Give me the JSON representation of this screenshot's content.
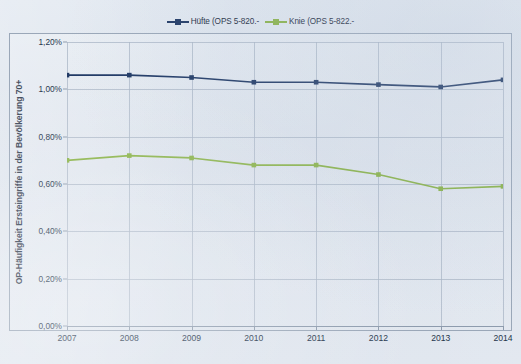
{
  "legend": {
    "position": "top-center",
    "entries": [
      {
        "label": "Hüfte (OPS 5-820.-",
        "color": "#1f3864",
        "marker": "square-marker"
      },
      {
        "label": "Knie (OPS 5-822.-",
        "color": "#8ab348",
        "marker": "square-marker"
      }
    ]
  },
  "axes": {
    "ylabel": "OP-Häufigkeit Ersteingriffe in der Bevölkerung 70+",
    "yticks": [
      "0,00%",
      "0,20%",
      "0,40%",
      "0,60%",
      "0,80%",
      "1,00%",
      "1,20%"
    ],
    "xticks": [
      "2007",
      "2008",
      "2009",
      "2010",
      "2011",
      "2012",
      "2013",
      "2014"
    ]
  },
  "colors": {
    "series_huefte": "#1f3864",
    "series_knie": "#8ab348",
    "gridline": "#a9b5c6",
    "frame": "#9aa7b8",
    "background": "#d9e1ec",
    "text": "#26364c"
  },
  "chart_data": {
    "type": "line",
    "title": "",
    "subtitle": "",
    "xlabel": "",
    "ylabel": "OP-Häufigkeit Ersteingriffe in der Bevölkerung 70+",
    "categories": [
      "2007",
      "2008",
      "2009",
      "2010",
      "2011",
      "2012",
      "2013",
      "2014"
    ],
    "x": [
      2007,
      2008,
      2009,
      2010,
      2011,
      2012,
      2013,
      2014
    ],
    "ylim": [
      0.0,
      1.2
    ],
    "ytick_values": [
      0.0,
      0.2,
      0.4,
      0.6,
      0.8,
      1.0,
      1.2
    ],
    "ytick_labels": [
      "0,00%",
      "0,20%",
      "0,40%",
      "0,60%",
      "0,80%",
      "1,00%",
      "1,20%"
    ],
    "yunit": "percent",
    "grid": true,
    "grid_axis": "both",
    "legend": true,
    "legend_position": "top-center",
    "markers": "square",
    "series": [
      {
        "name": "Hüfte (OPS 5-820.-",
        "color": "#1f3864",
        "values": [
          1.06,
          1.06,
          1.05,
          1.03,
          1.03,
          1.02,
          1.01,
          1.04
        ]
      },
      {
        "name": "Knie (OPS 5-822.-",
        "color": "#8ab348",
        "values": [
          0.7,
          0.72,
          0.71,
          0.68,
          0.68,
          0.64,
          0.58,
          0.59
        ]
      }
    ]
  }
}
